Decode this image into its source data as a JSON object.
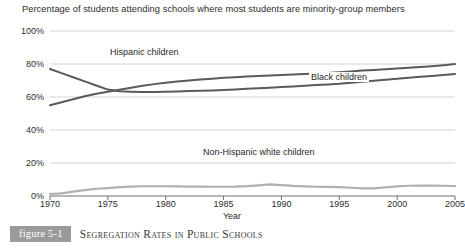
{
  "chart_data": {
    "type": "line",
    "title": "Percentage of students attending schools where most students are minority-group members",
    "xlabel": "Year",
    "ylabel": "",
    "xlim": [
      1970,
      2005
    ],
    "ylim": [
      0,
      100
    ],
    "grid": true,
    "gridlines_y": [
      0,
      20,
      40,
      60,
      80,
      100
    ],
    "legend_position": "inline-labels",
    "ytick_labels": [
      "100%",
      "80%",
      "60%",
      "40%",
      "20%",
      "0%"
    ],
    "ytick_values": [
      100,
      80,
      60,
      40,
      20,
      0
    ],
    "xtick_labels": [
      "1970",
      "1975",
      "1980",
      "1985",
      "1990",
      "1995",
      "2000",
      "2005"
    ],
    "xtick_values": [
      1970,
      1975,
      1980,
      1985,
      1990,
      1995,
      2000,
      2005
    ],
    "x": [
      1970,
      1971,
      1972,
      1973,
      1974,
      1975,
      1976,
      1977,
      1978,
      1979,
      1980,
      1981,
      1982,
      1983,
      1984,
      1985,
      1986,
      1987,
      1988,
      1989,
      1990,
      1991,
      1992,
      1993,
      1994,
      1995,
      1996,
      1997,
      1998,
      1999,
      2000,
      2001,
      2002,
      2003,
      2004,
      2005
    ],
    "series": [
      {
        "name": "Black children",
        "color": "#5a5a5a",
        "values": [
          77.0,
          74.5,
          72.0,
          69.5,
          67.0,
          64.5,
          63.5,
          63.2,
          63.0,
          63.0,
          63.2,
          63.4,
          63.6,
          63.8,
          64.0,
          64.3,
          64.6,
          65.0,
          65.3,
          65.6,
          66.0,
          66.4,
          66.8,
          67.2,
          67.6,
          68.0,
          68.6,
          69.2,
          69.8,
          70.4,
          71.0,
          71.6,
          72.2,
          72.8,
          73.4,
          74.0
        ]
      },
      {
        "name": "Hispanic children",
        "color": "#5a5a5a",
        "values": [
          55.0,
          56.8,
          58.6,
          60.4,
          62.0,
          63.2,
          64.4,
          65.6,
          66.8,
          67.8,
          68.6,
          69.4,
          70.0,
          70.6,
          71.1,
          71.6,
          72.0,
          72.4,
          72.8,
          73.1,
          73.4,
          73.7,
          74.0,
          74.3,
          74.6,
          75.0,
          75.5,
          76.0,
          76.4,
          76.8,
          77.2,
          77.7,
          78.2,
          78.7,
          79.3,
          80.0
        ]
      },
      {
        "name": "Non-Hispanic white children",
        "color": "#b0b0b0",
        "values": [
          1.2,
          1.6,
          2.6,
          3.6,
          4.4,
          4.8,
          5.4,
          5.7,
          5.9,
          5.9,
          5.9,
          5.8,
          5.7,
          5.7,
          5.6,
          5.6,
          5.7,
          6.0,
          6.5,
          7.0,
          6.6,
          6.1,
          5.8,
          5.6,
          5.5,
          5.4,
          5.0,
          4.6,
          4.6,
          5.2,
          5.8,
          6.2,
          6.3,
          6.3,
          6.2,
          6.0
        ]
      }
    ],
    "series_label_positions": [
      {
        "name": "Hispanic children",
        "x_px": 108,
        "y_px": 47
      },
      {
        "name": "Black children",
        "x_px": 309,
        "y_px": 72
      },
      {
        "name": "Non-Hispanic white children",
        "x_px": 201,
        "y_px": 147
      }
    ]
  },
  "caption": {
    "badge": "figure 5-1",
    "text": "Segregation Rates in Public Schools",
    "badge_color": "#9a9a9a"
  },
  "axes": {
    "x_axis_title": "Year"
  }
}
